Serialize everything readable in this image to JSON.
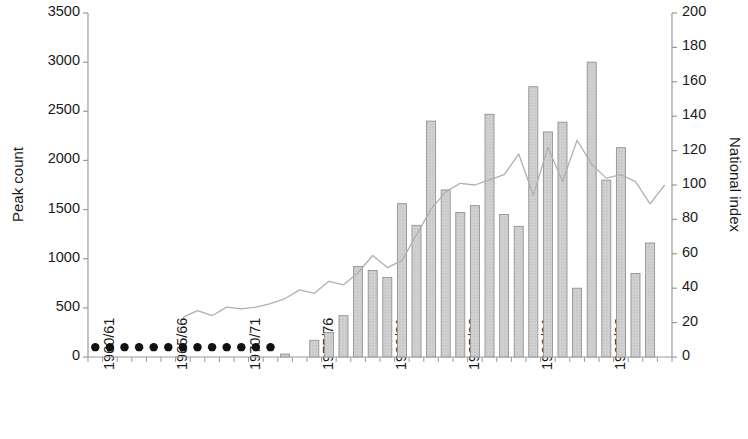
{
  "chart_data": {
    "type": "bar",
    "title": "",
    "xlabel": "",
    "ylabel": "Peak count",
    "y2label": "National index",
    "ylim": [
      0,
      3500
    ],
    "y2lim": [
      0,
      200
    ],
    "ytick_step": 500,
    "y2tick_step": 200,
    "grid": false,
    "legend": null,
    "yticks": [
      "0",
      "500",
      "1000",
      "1500",
      "2000",
      "2500",
      "3000",
      "3500"
    ],
    "y2ticks": [
      "0",
      "20",
      "40",
      "60",
      "80",
      "100",
      "120",
      "140",
      "160",
      "180",
      "200"
    ],
    "categories": [
      "1960/61",
      "1961/62",
      "1962/63",
      "1963/64",
      "1964/65",
      "1965/66",
      "1966/67",
      "1967/68",
      "1968/69",
      "1969/70",
      "1970/71",
      "1971/72",
      "1972/73",
      "1973/74",
      "1974/75",
      "1975/76",
      "1976/77",
      "1977/78",
      "1978/79",
      "1979/80",
      "1980/81",
      "1981/82",
      "1982/83",
      "1983/84",
      "1984/85",
      "1985/86",
      "1986/87",
      "1987/88",
      "1988/89",
      "1989/90",
      "1990/91",
      "1991/92",
      "1992/93",
      "1993/94",
      "1994/95",
      "1995/96",
      "1996/97",
      "1997/98",
      "1998/99",
      "1999/00"
    ],
    "xtick_labels": [
      "1960/61",
      "1965/66",
      "1970/71",
      "1975/76",
      "1980/81",
      "1985/86",
      "1990/91",
      "1995/96"
    ],
    "xtick_indices": [
      0,
      5,
      10,
      15,
      20,
      25,
      30,
      35
    ],
    "series": [
      {
        "name": "Peak count",
        "type": "bar",
        "axis": "left",
        "color": "#c8c8c8",
        "edge_color": "#8a8a8a",
        "values": [
          null,
          null,
          null,
          null,
          null,
          null,
          null,
          null,
          null,
          null,
          null,
          null,
          null,
          30,
          null,
          170,
          250,
          420,
          920,
          880,
          810,
          1560,
          1340,
          2400,
          1700,
          1470,
          1540,
          2470,
          1450,
          1330,
          2750,
          2290,
          2390,
          700,
          3000,
          1800,
          2130,
          850,
          1160,
          null
        ]
      },
      {
        "name": "No data marker",
        "type": "scatter",
        "axis": "left",
        "color": "#111111",
        "values": [
          100,
          100,
          100,
          100,
          100,
          100,
          100,
          100,
          100,
          100,
          100,
          100,
          100,
          null,
          null,
          null,
          null,
          null,
          null,
          null,
          null,
          null,
          null,
          null,
          null,
          null,
          null,
          null,
          null,
          null,
          null,
          null,
          null,
          null,
          null,
          null,
          null,
          null,
          null,
          null
        ]
      },
      {
        "name": "National index",
        "type": "line",
        "axis": "right",
        "color": "#b0b0b0",
        "values": [
          null,
          null,
          null,
          null,
          null,
          null,
          23,
          27,
          24,
          29,
          28,
          29,
          31,
          34,
          39,
          37,
          44,
          42,
          49,
          59,
          52,
          56,
          71,
          86,
          96,
          101,
          100,
          103,
          106,
          118,
          94,
          122,
          102,
          126,
          112,
          104,
          106,
          102,
          89,
          100
        ]
      }
    ]
  }
}
